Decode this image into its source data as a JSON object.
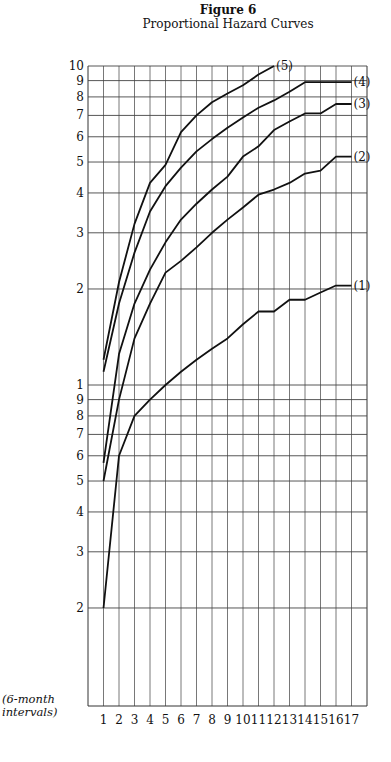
{
  "chart_data": {
    "type": "line",
    "title": "Figure 6",
    "subtitle": "Proportional Hazard Curves",
    "xlabel": "(6-month intervals)",
    "ylabel": "",
    "yscale": "log",
    "ylim": [
      0.15,
      10
    ],
    "grid": true,
    "x": [
      1,
      2,
      3,
      4,
      5,
      6,
      7,
      8,
      9,
      10,
      11,
      12,
      13,
      14,
      15,
      16,
      17
    ],
    "y_tick_labels_upper": [
      "10",
      "9",
      "8",
      "7",
      "6",
      "5",
      "4",
      "3",
      "2"
    ],
    "y_tick_labels_lower": [
      "1",
      "9",
      "8",
      "7",
      "6",
      "5",
      "4",
      "3",
      "2"
    ],
    "series": [
      {
        "name": "(5)",
        "values": [
          1.2,
          2.1,
          3.2,
          4.3,
          4.9,
          6.2,
          7.0,
          7.7,
          8.2,
          8.7,
          9.4,
          10.0,
          null,
          null,
          null,
          null,
          null
        ]
      },
      {
        "name": "(4)",
        "values": [
          1.1,
          1.8,
          2.6,
          3.5,
          4.2,
          4.8,
          5.4,
          5.9,
          6.4,
          6.9,
          7.4,
          7.8,
          8.3,
          8.9,
          8.9,
          8.9,
          8.9
        ]
      },
      {
        "name": "(3)",
        "values": [
          0.57,
          1.25,
          1.8,
          2.3,
          2.8,
          3.3,
          3.7,
          4.1,
          4.5,
          5.2,
          5.6,
          6.3,
          6.7,
          7.1,
          7.1,
          7.6,
          7.6
        ]
      },
      {
        "name": "(2)",
        "values": [
          0.5,
          0.9,
          1.4,
          1.8,
          2.25,
          2.45,
          2.7,
          3.0,
          3.3,
          3.6,
          3.95,
          4.1,
          4.3,
          4.6,
          4.7,
          5.2,
          5.2
        ]
      },
      {
        "name": "(1)",
        "values": [
          0.2,
          0.6,
          0.8,
          0.9,
          1.0,
          1.1,
          1.2,
          1.3,
          1.4,
          1.55,
          1.7,
          1.7,
          1.85,
          1.85,
          1.95,
          2.05,
          2.05
        ]
      }
    ],
    "legend_position": "inline-right-end-labels"
  }
}
